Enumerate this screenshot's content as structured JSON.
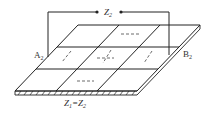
{
  "diagram": {
    "labels": {
      "top_impedance": "Z",
      "top_impedance_sub": "2",
      "left_terminal": "A",
      "left_terminal_sub": "2",
      "right_terminal": "B",
      "right_terminal_sub": "2",
      "bottom_equation_z1": "Z",
      "bottom_equation_z1_sub": "1",
      "bottom_equation_eq": "=Z",
      "bottom_equation_z2_sub": "2"
    },
    "grid": {
      "rows": 3,
      "cols": 3
    },
    "colors": {
      "line": "#222222",
      "text": "#333333",
      "background": "#ffffff"
    }
  }
}
